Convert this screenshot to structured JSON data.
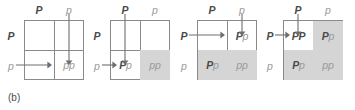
{
  "figure": {
    "caption": "(b)",
    "colors": {
      "shaded_cell": "#d5d5d5",
      "grid_line": "#8a8a8a",
      "dominant_text": "#4a4a4a",
      "recessive_text": "#9a9a9a",
      "arrow": "#6e6e6e",
      "background": "#ffffff"
    },
    "panels": [
      {
        "id": "panel-1",
        "col_headers": [
          {
            "symbol": "P",
            "type": "dominant"
          },
          {
            "symbol": "p",
            "type": "recessive"
          }
        ],
        "row_headers": [
          {
            "symbol": "P",
            "type": "dominant"
          },
          {
            "symbol": "p",
            "type": "recessive"
          }
        ],
        "cells": [
          {
            "position": "top-left",
            "genotype": "",
            "parts": [],
            "shaded": false
          },
          {
            "position": "top-right",
            "genotype": "",
            "parts": [],
            "shaded": false
          },
          {
            "position": "bottom-left",
            "genotype": "",
            "parts": [],
            "shaded": false
          },
          {
            "position": "bottom-right",
            "genotype": "pp",
            "parts": [
              {
                "symbol": "p",
                "type": "recessive"
              },
              {
                "symbol": "p",
                "type": "recessive"
              }
            ],
            "shaded": false
          }
        ],
        "arrows": [
          {
            "direction": "down",
            "from": "col-header-2",
            "to": "bottom-right",
            "length": "long"
          },
          {
            "direction": "right",
            "from": "row-header-2",
            "to": "bottom-right",
            "length": "long"
          }
        ]
      },
      {
        "id": "panel-2",
        "col_headers": [
          {
            "symbol": "P",
            "type": "dominant"
          },
          {
            "symbol": "p",
            "type": "recessive"
          }
        ],
        "row_headers": [
          {
            "symbol": "P",
            "type": "dominant"
          },
          {
            "symbol": "p",
            "type": "recessive"
          }
        ],
        "cells": [
          {
            "position": "top-left",
            "genotype": "",
            "parts": [],
            "shaded": false
          },
          {
            "position": "top-right",
            "genotype": "",
            "parts": [],
            "shaded": false
          },
          {
            "position": "bottom-left",
            "genotype": "Pp",
            "parts": [
              {
                "symbol": "P",
                "type": "dominant"
              },
              {
                "symbol": "p",
                "type": "recessive"
              }
            ],
            "shaded": false
          },
          {
            "position": "bottom-right",
            "genotype": "pp",
            "parts": [
              {
                "symbol": "p",
                "type": "recessive"
              },
              {
                "symbol": "p",
                "type": "recessive"
              }
            ],
            "shaded": true
          }
        ],
        "arrows": [
          {
            "direction": "down",
            "from": "col-header-1",
            "to": "bottom-left",
            "length": "long"
          },
          {
            "direction": "right",
            "from": "row-header-2",
            "to": "bottom-left",
            "length": "short"
          }
        ]
      },
      {
        "id": "panel-3",
        "col_headers": [
          {
            "symbol": "P",
            "type": "dominant"
          },
          {
            "symbol": "p",
            "type": "recessive"
          }
        ],
        "row_headers": [
          {
            "symbol": "P",
            "type": "dominant"
          },
          {
            "symbol": "p",
            "type": "recessive"
          }
        ],
        "cells": [
          {
            "position": "top-left",
            "genotype": "",
            "parts": [],
            "shaded": false
          },
          {
            "position": "top-right",
            "genotype": "Pp",
            "parts": [
              {
                "symbol": "P",
                "type": "dominant"
              },
              {
                "symbol": "p",
                "type": "recessive"
              }
            ],
            "shaded": false
          },
          {
            "position": "bottom-left",
            "genotype": "Pp",
            "parts": [
              {
                "symbol": "P",
                "type": "dominant"
              },
              {
                "symbol": "p",
                "type": "recessive"
              }
            ],
            "shaded": true
          },
          {
            "position": "bottom-right",
            "genotype": "pp",
            "parts": [
              {
                "symbol": "p",
                "type": "recessive"
              },
              {
                "symbol": "p",
                "type": "recessive"
              }
            ],
            "shaded": true
          }
        ],
        "arrows": [
          {
            "direction": "down",
            "from": "col-header-2",
            "to": "top-right",
            "length": "short"
          },
          {
            "direction": "right",
            "from": "row-header-1",
            "to": "top-right",
            "length": "long"
          }
        ]
      },
      {
        "id": "panel-4",
        "col_headers": [
          {
            "symbol": "P",
            "type": "dominant"
          },
          {
            "symbol": "p",
            "type": "recessive"
          }
        ],
        "row_headers": [
          {
            "symbol": "P",
            "type": "dominant"
          },
          {
            "symbol": "p",
            "type": "recessive"
          }
        ],
        "cells": [
          {
            "position": "top-left",
            "genotype": "PP",
            "parts": [
              {
                "symbol": "P",
                "type": "dominant"
              },
              {
                "symbol": "P",
                "type": "dominant"
              }
            ],
            "shaded": false
          },
          {
            "position": "top-right",
            "genotype": "Pp",
            "parts": [
              {
                "symbol": "P",
                "type": "dominant"
              },
              {
                "symbol": "p",
                "type": "recessive"
              }
            ],
            "shaded": true
          },
          {
            "position": "bottom-left",
            "genotype": "Pp",
            "parts": [
              {
                "symbol": "P",
                "type": "dominant"
              },
              {
                "symbol": "p",
                "type": "recessive"
              }
            ],
            "shaded": true
          },
          {
            "position": "bottom-right",
            "genotype": "pp",
            "parts": [
              {
                "symbol": "p",
                "type": "recessive"
              },
              {
                "symbol": "p",
                "type": "recessive"
              }
            ],
            "shaded": true
          }
        ],
        "arrows": [
          {
            "direction": "down",
            "from": "col-header-1",
            "to": "top-left",
            "length": "short"
          },
          {
            "direction": "right",
            "from": "row-header-1",
            "to": "top-left",
            "length": "short"
          }
        ]
      }
    ]
  }
}
